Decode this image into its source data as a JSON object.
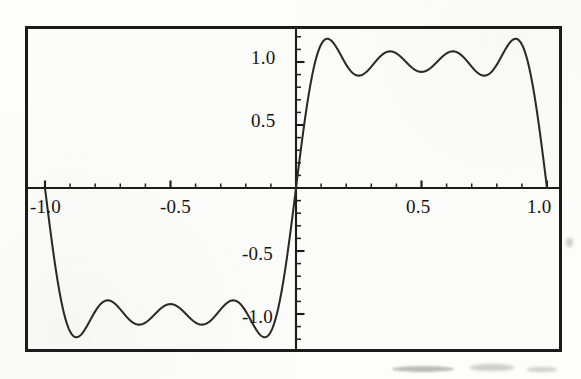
{
  "figure": {
    "kind": "mathematical-function-plot",
    "frame_visible": true
  },
  "chart_data": {
    "type": "line",
    "title": "",
    "subtitle": "",
    "xlabel": "",
    "ylabel": "",
    "xlim": [
      -1.07,
      1.07
    ],
    "ylim": [
      -1.29,
      1.29
    ],
    "grid": false,
    "legend": null,
    "legend_position": "none",
    "x_ticks_major": [
      "-1.0",
      "-0.5",
      "0.5",
      "1.0"
    ],
    "x_tick_values_major": [
      -1.0,
      -0.5,
      0.5,
      1.0
    ],
    "x_tick_values_minor": [
      -0.9,
      -0.8,
      -0.7,
      -0.6,
      -0.4,
      -0.3,
      -0.2,
      -0.1,
      0.1,
      0.2,
      0.3,
      0.4,
      0.6,
      0.7,
      0.8,
      0.9
    ],
    "y_ticks_major": [
      "1.0",
      "0.5",
      "-0.5",
      "-1.0"
    ],
    "y_tick_values_major": [
      1.0,
      0.5,
      -0.5,
      -1.0
    ],
    "y_tick_values_minor": [
      0.1,
      0.2,
      0.3,
      0.4,
      0.6,
      0.7,
      0.8,
      0.9,
      1.1,
      1.2,
      -0.1,
      -0.2,
      -0.3,
      -0.4,
      -0.6,
      -0.7,
      -0.8,
      -0.9,
      -1.1,
      -1.2
    ],
    "series": [
      {
        "name": "partial Fourier sum",
        "color": "#2a2a2a",
        "harmonics": 7,
        "formula": "f(x) = (4/pi) * sum_{k=0}^{3} sin((2k+1)*pi*x) / (2k+1)",
        "key_points": [
          {
            "x": -1.0,
            "y": 0.0,
            "note": "left endpoint, jump"
          },
          {
            "x": -0.875,
            "y": -1.18,
            "note": "Gibbs overshoot (negative)"
          },
          {
            "x": -0.75,
            "y": -0.88,
            "note": "ripple trough"
          },
          {
            "x": -0.625,
            "y": -1.13,
            "note": "ripple peak"
          },
          {
            "x": -0.5,
            "y": -0.89,
            "note": "ripple trough"
          },
          {
            "x": -0.375,
            "y": -1.13,
            "note": "ripple peak"
          },
          {
            "x": -0.25,
            "y": -0.88,
            "note": "ripple trough"
          },
          {
            "x": -0.125,
            "y": -1.18,
            "note": "Gibbs overshoot (negative)"
          },
          {
            "x": 0.0,
            "y": 0.0,
            "note": "center jump discontinuity"
          },
          {
            "x": 0.125,
            "y": 1.18,
            "note": "Gibbs overshoot"
          },
          {
            "x": 0.25,
            "y": 0.88,
            "note": "ripple trough"
          },
          {
            "x": 0.375,
            "y": 1.13,
            "note": "ripple peak"
          },
          {
            "x": 0.5,
            "y": 0.89,
            "note": "ripple trough"
          },
          {
            "x": 0.625,
            "y": 1.13,
            "note": "ripple peak"
          },
          {
            "x": 0.75,
            "y": 0.88,
            "note": "ripple trough"
          },
          {
            "x": 0.875,
            "y": 1.18,
            "note": "Gibbs overshoot"
          },
          {
            "x": 1.0,
            "y": 0.0,
            "note": "right endpoint, jump"
          }
        ],
        "overshoot_max": 1.18,
        "ripple_min": 0.88
      }
    ]
  },
  "axis_labels": {
    "x_neg_one": "-1.0",
    "x_neg_half": "-0.5",
    "x_pos_half": "0.5",
    "x_pos_one": "1.0",
    "y_pos_one": "1.0",
    "y_pos_half": "0.5",
    "y_neg_half": "-0.5",
    "y_neg_one": "-1.0"
  },
  "colors": {
    "curve": "#2a2a2a",
    "axis": "#1c1c1c",
    "frame": "#1b1b1b",
    "text": "#141414",
    "background": "#fcfcfa"
  }
}
